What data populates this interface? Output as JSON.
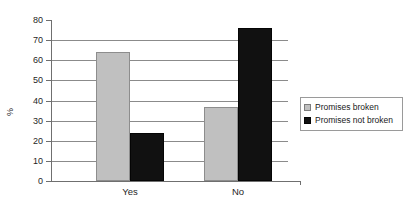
{
  "chart_data": {
    "type": "bar",
    "title": "",
    "xlabel": "",
    "ylabel": "%",
    "categories": [
      "Yes",
      "No"
    ],
    "series": [
      {
        "name": "Promises broken",
        "color": "#c0c0c0",
        "values": [
          64,
          37
        ]
      },
      {
        "name": "Promises not broken",
        "color": "#111111",
        "values": [
          24,
          76
        ]
      }
    ],
    "ylim": [
      0,
      80
    ],
    "ytick_step": 10,
    "ytick_labels": [
      "80",
      "70",
      "60",
      "50",
      "40",
      "30",
      "20",
      "10",
      "0"
    ],
    "ytick_values": [
      80,
      70,
      60,
      50,
      40,
      30,
      20,
      10,
      0
    ],
    "grid": true,
    "grid_axis": "y",
    "legend_position": "right"
  },
  "legend": {
    "entries": [
      {
        "label": "Promises broken"
      },
      {
        "label": "Promises not broken"
      }
    ]
  },
  "axis": {
    "y_title": "%"
  }
}
